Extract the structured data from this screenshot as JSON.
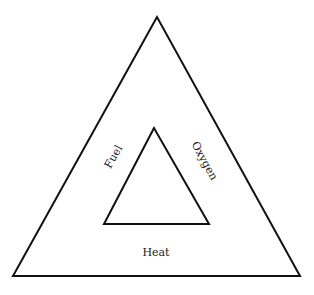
{
  "diagram": {
    "stroke_color": "#111111",
    "background": "#ffffff",
    "outer_triangle": {
      "points": "157,17 13,276 300,276"
    },
    "inner_triangle": {
      "points": "154,128 104,224 209,224"
    },
    "labels": {
      "fuel": "Fuel",
      "oxygen": "Oxygen",
      "heat": "Heat"
    }
  }
}
